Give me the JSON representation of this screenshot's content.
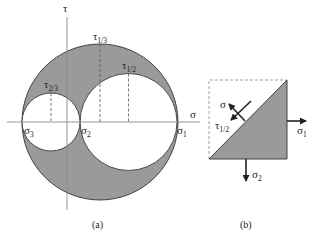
{
  "figure": {
    "panel_a": {
      "caption": "(a)",
      "axes": {
        "horizontal_label": "σ",
        "vertical_label": "τ"
      },
      "principal_stresses": [
        {
          "symbol": "σ",
          "subscript": "3"
        },
        {
          "symbol": "σ",
          "subscript": "2"
        },
        {
          "symbol": "σ",
          "subscript": "1"
        }
      ],
      "shear_labels": [
        {
          "symbol": "τ",
          "subscript": "1/3"
        },
        {
          "symbol": "τ",
          "subscript": "1/2"
        },
        {
          "symbol": "τ",
          "subscript": "2/3"
        }
      ],
      "circles": [
        {
          "name": "circle-1-3",
          "between": [
            "σ3",
            "σ1"
          ],
          "role": "outer"
        },
        {
          "name": "circle-1-2",
          "between": [
            "σ2",
            "σ1"
          ],
          "role": "inner"
        },
        {
          "name": "circle-2-3",
          "between": [
            "σ3",
            "σ2"
          ],
          "role": "inner"
        }
      ],
      "colors": {
        "shaded_region": "#9a9a9a",
        "line": "#333333",
        "axis": "#8a8a8a"
      }
    },
    "panel_b": {
      "caption": "(b)",
      "labels": {
        "normal": "σ",
        "shear_symbol": "τ",
        "shear_subscript": "1/2",
        "right_stress_symbol": "σ",
        "right_stress_subscript": "1",
        "bottom_stress_symbol": "σ",
        "bottom_stress_subscript": "2"
      }
    }
  }
}
